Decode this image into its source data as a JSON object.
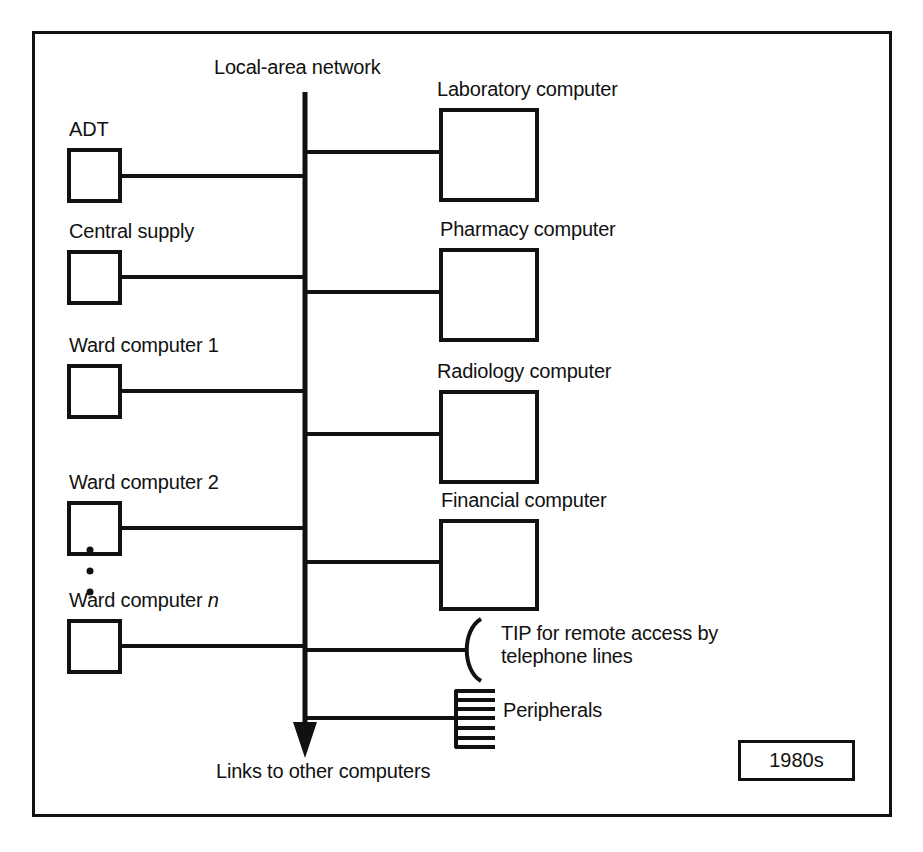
{
  "figure": {
    "type": "diagram",
    "era_badge": "1980s",
    "bus_label": "Local-area network",
    "terminus_label": "Links to other computers"
  },
  "left_nodes": [
    {
      "label": "ADT",
      "kind": "box"
    },
    {
      "label": "Central supply",
      "kind": "box"
    },
    {
      "label": "Ward computer 1",
      "kind": "box"
    },
    {
      "label": "Ward computer 2",
      "kind": "box"
    },
    {
      "label_prefix": "Ward computer ",
      "label_italic": "n",
      "kind": "box"
    }
  ],
  "left_ellipsis": "•",
  "right_nodes": [
    {
      "label": "Laboratory computer",
      "kind": "box"
    },
    {
      "label": "Pharmacy computer",
      "kind": "box"
    },
    {
      "label": "Radiology computer",
      "kind": "box"
    },
    {
      "label": "Financial computer",
      "kind": "box"
    }
  ],
  "right_devices": [
    {
      "label_line1": "TIP for remote access by",
      "label_line2": "telephone lines",
      "kind": "arc"
    },
    {
      "label_line1": "Peripherals",
      "label_line2": "",
      "kind": "stack"
    }
  ],
  "colors": {
    "stroke": "#111111",
    "background": "#ffffff",
    "text": "#111111"
  }
}
